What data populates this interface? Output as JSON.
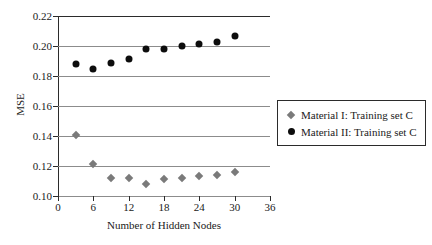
{
  "chart_data": {
    "type": "scatter",
    "title": "",
    "xlabel": "Number of Hidden Nodes",
    "ylabel": "MSE",
    "xlim": [
      0,
      36
    ],
    "ylim": [
      0.1,
      0.22
    ],
    "xticks": [
      "0",
      "6",
      "12",
      "18",
      "24",
      "30",
      "36"
    ],
    "xtick_values": [
      0,
      6,
      12,
      18,
      24,
      30,
      36
    ],
    "yticks": [
      "0.10",
      "0.12",
      "0.14",
      "0.16",
      "0.18",
      "0.20",
      "0.22"
    ],
    "ytick_values": [
      0.1,
      0.12,
      0.14,
      0.16,
      0.18,
      0.2,
      0.22
    ],
    "grid": "horizontal",
    "legend_position": "lower-right-inside",
    "series": [
      {
        "name": "Material I: Training set C",
        "marker": "diamond",
        "color": "#7a7a7a",
        "x": [
          3,
          6,
          9,
          12,
          15,
          18,
          21,
          24,
          27,
          30
        ],
        "values": [
          0.141,
          0.1215,
          0.1123,
          0.112,
          0.1078,
          0.1115,
          0.1122,
          0.1135,
          0.1142,
          0.116
        ]
      },
      {
        "name": "Material II: Training set C",
        "marker": "circle",
        "color": "#0d0d0d",
        "x": [
          3,
          6,
          9,
          12,
          15,
          18,
          21,
          24,
          27,
          30
        ],
        "values": [
          0.188,
          0.1848,
          0.1888,
          0.1912,
          0.198,
          0.1978,
          0.1998,
          0.2013,
          0.203,
          0.207
        ]
      }
    ]
  },
  "legend": {
    "entries": [
      {
        "label": "Material I: Training set C",
        "marker": "diamond"
      },
      {
        "label": "Material II: Training set C",
        "marker": "circle"
      }
    ]
  }
}
